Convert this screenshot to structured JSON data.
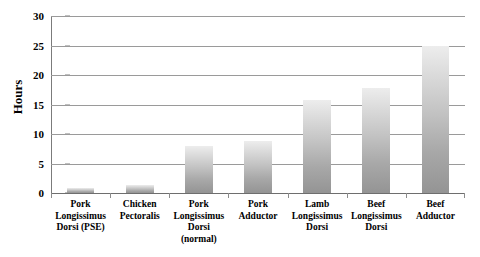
{
  "chart_data": {
    "type": "bar",
    "title": "",
    "xlabel": "",
    "ylabel": "Hours",
    "ylim": [
      0,
      30
    ],
    "yticks": [
      0,
      5,
      10,
      15,
      20,
      25,
      30
    ],
    "ytick_labels": [
      "0",
      "5",
      "10",
      "15",
      "20",
      "25",
      "30"
    ],
    "grid": true,
    "legend": false,
    "legend_position": "none",
    "bar_fill": "#c3c3c3",
    "bar_gradient_top": "#ededed",
    "bar_gradient_bottom": "#949494",
    "gridline_color": "#9a9a9a",
    "axis_color": "#7b7b7b",
    "categories": [
      "Pork Longissimus Dorsi (PSE)",
      "Chicken Pectoralis",
      "Pork Longissimus Dorsi (normal)",
      "Pork Adductor",
      "Lamb Longissimus Dorsi",
      "Beef Longissimus Dorsi",
      "Beef Adductor"
    ],
    "category_lines": [
      [
        "Pork",
        "Longissimus",
        "Dorsi (PSE)"
      ],
      [
        "Chicken",
        "Pectoralis"
      ],
      [
        "Pork",
        "Longissimus",
        "Dorsi",
        "(normal)"
      ],
      [
        "Pork",
        "Adductor"
      ],
      [
        "Lamb",
        "Longissimus",
        "Dorsi"
      ],
      [
        "Beef",
        "Longissimus",
        "Dorsi"
      ],
      [
        "Beef",
        "Adductor"
      ]
    ],
    "values": [
      0.8,
      1.4,
      7.9,
      8.9,
      15.8,
      17.8,
      25.0
    ]
  }
}
